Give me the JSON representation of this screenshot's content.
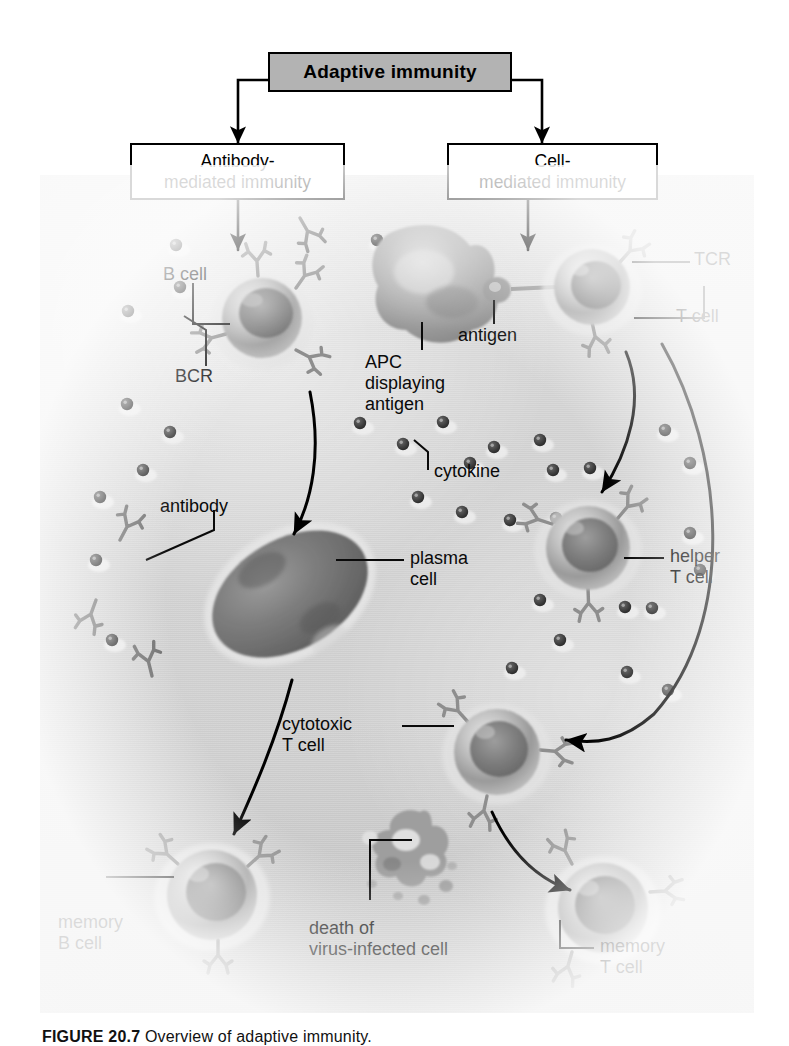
{
  "figure": {
    "domain": "biology-diagram",
    "caption_number": "FIGURE 20.7",
    "caption_text": "Overview of adaptive immunity.",
    "background_note": "grayscale electron-micrograph style panel"
  },
  "flowchart": {
    "title_box": "Adaptive immunity",
    "branches": [
      {
        "id": "antibody",
        "label": "Antibody-\nmediated immunity"
      },
      {
        "id": "cell",
        "label": "Cell-\nmediated immunity"
      }
    ]
  },
  "labels": {
    "b_cell": "B cell",
    "bcr": "BCR",
    "apc": "APC\ndisplaying\nantigen",
    "antigen": "antigen",
    "tcr": "TCR",
    "t_cell": "T cell",
    "antibody": "antibody",
    "cytokine": "cytokine",
    "plasma_cell": "plasma\ncell",
    "helper_t_cell": "helper\nT cell",
    "cytotoxic_t_cell": "cytotoxic\nT cell",
    "memory_b_cell": "memory\nB cell",
    "death_cell": "death of\nvirus-infected cell",
    "memory_t_cell": "memory\nT cell"
  },
  "colors": {
    "title_box_fill": "#b3b3b3",
    "box_stroke": "#000000",
    "panel_base": "#d2d2d2",
    "text": "#0a0a0a",
    "cell_body": "#a9a9a9",
    "cell_dark": "#6f6f6f",
    "receptor": "#8c8c8c"
  },
  "cells": [
    {
      "name": "b-cell",
      "cx": 262,
      "cy": 318,
      "r": 40
    },
    {
      "name": "apc",
      "cx": 432,
      "cy": 285,
      "r": 55
    },
    {
      "name": "t-cell",
      "cx": 592,
      "cy": 287,
      "r": 38
    },
    {
      "name": "plasma-cell",
      "cx": 290,
      "cy": 594,
      "r": 72
    },
    {
      "name": "helper-t-cell",
      "cx": 588,
      "cy": 548,
      "r": 42
    },
    {
      "name": "cytotoxic-t-cell",
      "cx": 497,
      "cy": 752,
      "r": 43
    },
    {
      "name": "memory-b-cell",
      "cx": 212,
      "cy": 895,
      "r": 45
    },
    {
      "name": "memory-t-cell",
      "cx": 603,
      "cy": 908,
      "r": 45
    }
  ],
  "cytokine_dots": [
    [
      176,
      245
    ],
    [
      180,
      287
    ],
    [
      128,
      311
    ],
    [
      127,
      404
    ],
    [
      170,
      432
    ],
    [
      377,
      240
    ],
    [
      405,
      240
    ],
    [
      360,
      423
    ],
    [
      403,
      444
    ],
    [
      443,
      422
    ],
    [
      470,
      463
    ],
    [
      494,
      447
    ],
    [
      540,
      440
    ],
    [
      553,
      470
    ],
    [
      590,
      468
    ],
    [
      462,
      512
    ],
    [
      418,
      497
    ],
    [
      510,
      520
    ],
    [
      556,
      518
    ],
    [
      665,
      430
    ],
    [
      690,
      463
    ],
    [
      625,
      607
    ],
    [
      652,
      608
    ],
    [
      540,
      600
    ],
    [
      560,
      640
    ],
    [
      690,
      533
    ],
    [
      700,
      570
    ],
    [
      627,
      672
    ],
    [
      668,
      690
    ],
    [
      512,
      668
    ],
    [
      96,
      560
    ],
    [
      112,
      640
    ],
    [
      143,
      470
    ],
    [
      100,
      497
    ]
  ]
}
